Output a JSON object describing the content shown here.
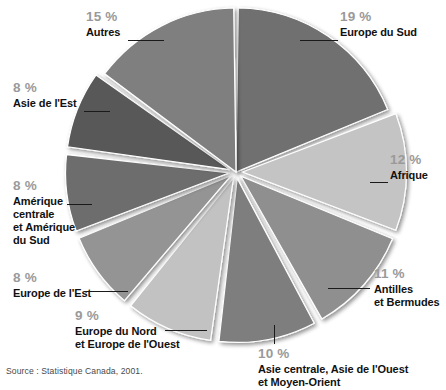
{
  "figure": {
    "source_note": "Source : Statistique Canada, 2001.",
    "background_color": "#ffffff",
    "percent_text_color": "#9a9a9a",
    "label_text_color": "#111111",
    "leader_line_color": "#1a1a1a"
  },
  "chart_data": {
    "type": "pie",
    "title": "",
    "subtitle": "",
    "xlabel": "",
    "ylabel": "",
    "legend_position": "callout-labels",
    "grid": false,
    "units": "%",
    "start_angle_deg": 0,
    "direction": "clockwise",
    "categories": [
      "Europe du Sud",
      "Afrique",
      "Antilles et Bermudes",
      "Asie centrale, Asie de l'Ouest et Moyen-Orient",
      "Europe du Nord et Europe de l'Ouest",
      "Europe de l'Est",
      "Amérique centrale et Amérique du Sud",
      "Asie de l'Est",
      "Autres"
    ],
    "values": [
      19,
      12,
      11,
      10,
      9,
      8,
      8,
      8,
      15
    ],
    "colors": [
      "#6f6f6f",
      "#c4c4c4",
      "#8f8f8f",
      "#7e7e7e",
      "#c2c2c2",
      "#949494",
      "#6d6d6d",
      "#595959",
      "#7f7f7f"
    ],
    "slices": [
      {
        "key": "europe-du-sud",
        "label": "Europe du Sud",
        "value": 19,
        "percent_text": "19 %",
        "color": "#6f6f6f",
        "exploded": false
      },
      {
        "key": "afrique",
        "label": "Afrique",
        "value": 12,
        "percent_text": "12 %",
        "color": "#c4c4c4",
        "exploded": true
      },
      {
        "key": "antilles",
        "label": "Antilles et Bermudes",
        "value": 11,
        "percent_text": "11 %",
        "color": "#8f8f8f",
        "exploded": true
      },
      {
        "key": "asie-centrale",
        "label": "Asie centrale, Asie de l'Ouest et Moyen-Orient",
        "value": 10,
        "percent_text": "10 %",
        "color": "#7e7e7e",
        "exploded": true
      },
      {
        "key": "europe-nord-ouest",
        "label": "Europe du Nord et Europe de l'Ouest",
        "value": 9,
        "percent_text": "9 %",
        "color": "#c2c2c2",
        "exploded": true
      },
      {
        "key": "europe-est",
        "label": "Europe de l'Est",
        "value": 8,
        "percent_text": "8 %",
        "color": "#949494",
        "exploded": true
      },
      {
        "key": "amerique",
        "label": "Amérique centrale et Amérique du Sud",
        "value": 8,
        "percent_text": "8 %",
        "color": "#6d6d6d",
        "exploded": true
      },
      {
        "key": "asie-est",
        "label": "Asie de l'Est",
        "value": 8,
        "percent_text": "8 %",
        "color": "#595959",
        "exploded": true
      },
      {
        "key": "autres",
        "label": "Autres",
        "value": 15,
        "percent_text": "15 %",
        "color": "#7f7f7f",
        "exploded": false
      }
    ]
  },
  "labels": {
    "europe_du_sud": {
      "percent": "19 %",
      "name": "Europe du Sud"
    },
    "afrique": {
      "percent": "12 %",
      "name": "Afrique"
    },
    "antilles": {
      "percent": "11 %",
      "line1": "Antilles",
      "line2": "et Bermudes"
    },
    "asie_centrale": {
      "percent": "10 %",
      "line1": "Asie centrale, Asie de l'Ouest",
      "line2": "et Moyen-Orient"
    },
    "europe_nord": {
      "percent": "9 %",
      "line1": "Europe du Nord",
      "line2": "et Europe de l'Ouest"
    },
    "europe_est": {
      "percent": "8 %",
      "name": "Europe de l'Est"
    },
    "amerique": {
      "percent": "8 %",
      "line1": "Amérique",
      "line2": "centrale",
      "line3": "et Amérique",
      "line4": "du Sud"
    },
    "asie_est": {
      "percent": "8 %",
      "name": "Asie de l'Est"
    },
    "autres": {
      "percent": "15 %",
      "name": "Autres"
    }
  }
}
